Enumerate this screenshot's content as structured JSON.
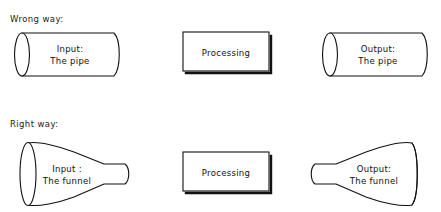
{
  "figure": {
    "background_color": "#ffffff",
    "line_color": "#111111",
    "text_color": "#111111"
  },
  "rows": [
    {
      "id": "wrong-way",
      "label": "Wrong way:",
      "shapes": [
        {
          "id": "input-pipe",
          "kind": "cylinder",
          "line1": "Input:",
          "line2": "The pipe"
        },
        {
          "id": "processing",
          "kind": "box",
          "line1": "Processing",
          "line2": ""
        },
        {
          "id": "output-pipe",
          "kind": "cylinder",
          "line1": "Output:",
          "line2": "The pipe"
        }
      ]
    },
    {
      "id": "right-way",
      "label": "Right way:",
      "shapes": [
        {
          "id": "input-funnel",
          "kind": "funnel-right",
          "line1": "Input :",
          "line2": "The funnel"
        },
        {
          "id": "processing",
          "kind": "box",
          "line1": "Processing",
          "line2": ""
        },
        {
          "id": "output-funnel",
          "kind": "funnel-left",
          "line1": "Output:",
          "line2": "The funnel"
        }
      ]
    }
  ]
}
